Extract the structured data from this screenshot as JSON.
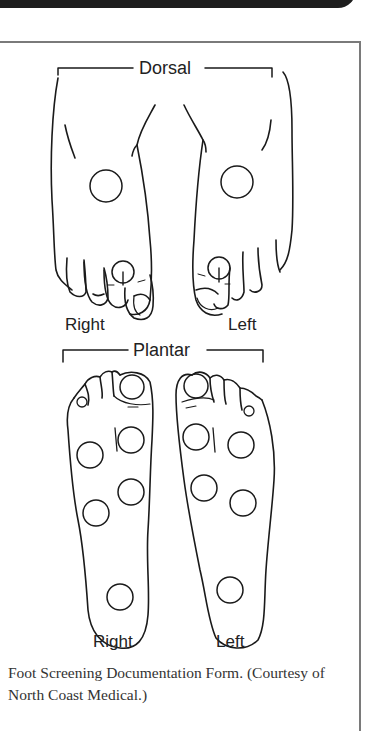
{
  "figure": {
    "dorsal_label": "Dorsal",
    "plantar_label": "Plantar",
    "dorsal_right_label": "Right",
    "dorsal_left_label": "Left",
    "plantar_right_label": "Right",
    "plantar_left_label": "Left"
  },
  "caption": {
    "text": "Foot Screening Documentation Form. (Courtesy of North Coast Medical.)"
  },
  "colors": {
    "line": "#1a1a1a",
    "frame": "#7a7a7a",
    "topbar": "#1e1e1e"
  }
}
